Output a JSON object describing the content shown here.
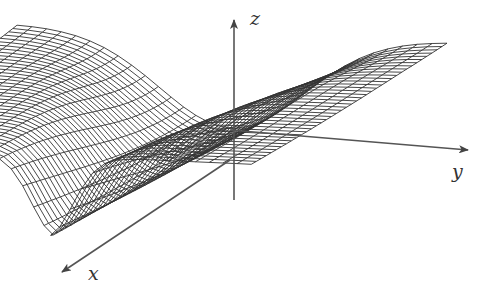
{
  "figure": {
    "type": "3d-wireframe-surface",
    "line_color": "#333333",
    "background": "#ffffff"
  },
  "axes": {
    "x": {
      "label": "x",
      "label_pos": [
        88,
        262
      ],
      "tail": [
        230,
        160
      ],
      "head": [
        62,
        272
      ]
    },
    "y": {
      "label": "y",
      "label_pos": [
        452,
        160
      ],
      "tail": [
        230,
        130
      ],
      "head": [
        468,
        150
      ]
    },
    "z": {
      "label": "z",
      "label_pos": [
        250,
        7
      ],
      "tail": [
        234,
        200
      ],
      "head": [
        234,
        20
      ]
    }
  },
  "mesh": {
    "u_count": 34,
    "v_count": 40,
    "u_range": [
      -3,
      3
    ],
    "v_range": [
      0,
      2.6
    ]
  }
}
